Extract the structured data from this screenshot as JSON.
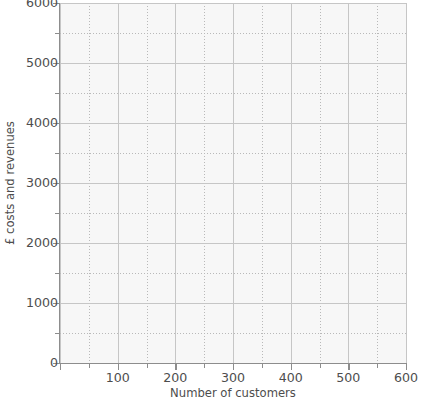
{
  "chart_data": {
    "type": "line",
    "title": "",
    "subtitle": "",
    "xlabel": "Number of customers",
    "ylabel": "£ costs and revenues",
    "xlim": [
      0,
      600
    ],
    "ylim": [
      0,
      6000
    ],
    "x_ticks": [
      0,
      100,
      200,
      300,
      400,
      500,
      600
    ],
    "x_tick_labels": [
      "",
      "100",
      "200",
      "300",
      "400",
      "500",
      "600"
    ],
    "x_minor_step": 50,
    "y_ticks": [
      0,
      1000,
      2000,
      3000,
      4000,
      5000,
      6000
    ],
    "y_tick_labels": [
      "0",
      "1000",
      "2000",
      "3000",
      "4000",
      "5000",
      "6000"
    ],
    "y_minor_step": 500,
    "grid": true,
    "grid_style": "dotted",
    "legend": false,
    "legend_position": "none",
    "series": [],
    "annotations": [],
    "note": "Empty graph-paper axes template with no plotted data series."
  },
  "axes": {
    "y_title": "£ costs and revenues",
    "x_title": "Number of customers",
    "y_labels": [
      {
        "value": 6000,
        "text": "6000"
      },
      {
        "value": 5000,
        "text": "5000"
      },
      {
        "value": 4000,
        "text": "4000"
      },
      {
        "value": 3000,
        "text": "3000"
      },
      {
        "value": 2000,
        "text": "2000"
      },
      {
        "value": 1000,
        "text": "1000"
      },
      {
        "value": 0,
        "text": "0"
      }
    ],
    "x_labels": [
      {
        "value": 100,
        "text": "100"
      },
      {
        "value": 200,
        "text": "200"
      },
      {
        "value": 300,
        "text": "300"
      },
      {
        "value": 400,
        "text": "400"
      },
      {
        "value": 500,
        "text": "500"
      },
      {
        "value": 600,
        "text": "600"
      }
    ]
  },
  "colors": {
    "plot_background": "#f7f7f7",
    "page_background": "#ffffff",
    "axis_line": "#8d8d8d",
    "major_grid": "#c6c6c6",
    "minor_grid": "#b9b9b9",
    "text": "#4d4d4d"
  }
}
